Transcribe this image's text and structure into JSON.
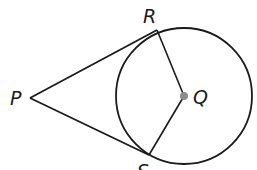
{
  "diagram": {
    "stroke_color": "#1a1a1a",
    "center_dot_color": "#8c8c8c",
    "circle": {
      "name": "Q",
      "cx": 184,
      "cy": 96,
      "r": 68
    },
    "points": {
      "P": {
        "label": "P",
        "x": 30,
        "y": 98
      },
      "R": {
        "label": "R",
        "x": 157,
        "y": 30
      },
      "S": {
        "label": "S",
        "x": 149,
        "y": 155
      },
      "Q": {
        "label": "Q",
        "x": 184,
        "y": 96
      }
    },
    "segments": [
      {
        "name": "PR",
        "type": "tangent"
      },
      {
        "name": "PS",
        "type": "tangent"
      },
      {
        "name": "QR",
        "type": "radius"
      },
      {
        "name": "QS",
        "type": "radius"
      }
    ]
  }
}
